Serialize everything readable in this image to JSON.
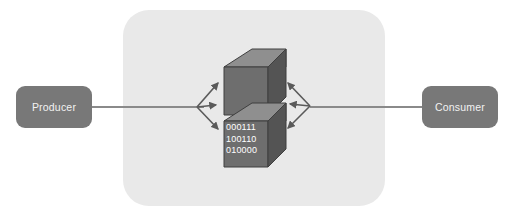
{
  "diagram": {
    "background_color": "#ffffff",
    "panel": {
      "name": "broker-panel",
      "fill_color": "#e9e9e9",
      "corner_radius": 26
    },
    "nodes": [
      {
        "id": "producer",
        "label": "Producer",
        "fill_color": "#787878",
        "text_color": "#f2f2f2"
      },
      {
        "id": "consumer",
        "label": "Consumer",
        "fill_color": "#787878",
        "text_color": "#f2f2f2"
      }
    ],
    "connectors": [
      {
        "id": "producer-connector",
        "from": "producer",
        "to": "left-arrow-fan",
        "color": "#8a8a8a"
      },
      {
        "id": "consumer-connector",
        "from": "right-arrow-fan",
        "to": "consumer",
        "color": "#8a8a8a"
      }
    ],
    "cube_stack": {
      "name": "message-cube-stack",
      "count": 2,
      "top_face_color": "#8f8f8f",
      "front_face_color": "#6e6e6e",
      "side_face_color": "#545454",
      "edge_color": "#3f3f3f"
    },
    "payload": {
      "name": "binary-payload",
      "text_color": "#ffffff",
      "lines": [
        "000111",
        "100110",
        "010000"
      ]
    },
    "arrow_fans": [
      {
        "id": "left-arrow-fan",
        "direction": "into-cube",
        "arrow_count": 3,
        "color": "#5a5a5a"
      },
      {
        "id": "right-arrow-fan",
        "direction": "out-of-cube",
        "arrow_count": 3,
        "color": "#5a5a5a"
      }
    ]
  }
}
